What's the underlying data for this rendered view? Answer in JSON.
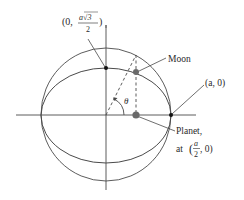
{
  "diagram": {
    "title": "",
    "colors": {
      "line": "#4a4a4a",
      "dot_dark": "#111111",
      "dot_gray": "#6a6a6a",
      "text": "#2a2a2a",
      "background": "#ffffff"
    },
    "axes": {
      "x_axis": true,
      "y_axis": true
    },
    "shapes": {
      "circle": {
        "label": "auxiliary circle",
        "radius_symbol": "a"
      },
      "ellipse": {
        "label": "orbit",
        "semi_major": "a",
        "semi_minor": "a√3/2"
      }
    },
    "labels": {
      "top_point": {
        "open": "(0, ",
        "numerator": "a√3",
        "denominator": "2",
        "close": ")"
      },
      "right_point": "(a, 0)",
      "moon": "Moon",
      "planet_line1": "Planet,",
      "planet_line2_prefix": "at ",
      "planet_numerator": "a",
      "planet_denominator": "2",
      "planet_suffix": ", 0)",
      "planet_open": "(",
      "angle": "θ"
    },
    "points": [
      {
        "name": "top-of-ellipse",
        "coord": "(0, a√3/2)"
      },
      {
        "name": "right-vertex",
        "coord": "(a, 0)"
      },
      {
        "name": "moon",
        "coord": "on ellipse"
      },
      {
        "name": "planet",
        "coord": "(a/2, 0)"
      }
    ]
  }
}
